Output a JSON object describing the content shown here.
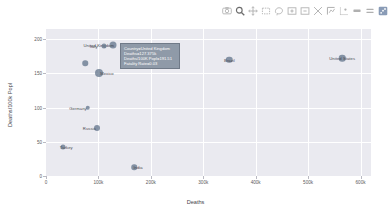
{
  "modebar": {
    "buttons": [
      {
        "name": "download-plot-icon",
        "label": "Download plot as a png"
      },
      {
        "name": "zoom-icon",
        "label": "Zoom"
      },
      {
        "name": "pan-icon",
        "label": "Pan"
      },
      {
        "name": "box-select-icon",
        "label": "Box Select"
      },
      {
        "name": "lasso-select-icon",
        "label": "Lasso Select"
      },
      {
        "name": "zoom-in-icon",
        "label": "Zoom in"
      },
      {
        "name": "zoom-out-icon",
        "label": "Zoom out"
      },
      {
        "name": "autoscale-icon",
        "label": "Autoscale"
      },
      {
        "name": "reset-axes-icon",
        "label": "Reset axes"
      },
      {
        "name": "toggle-spike-lines-icon",
        "label": "Toggle Spike Lines"
      },
      {
        "name": "hover-compare-icon",
        "label": "Show closest data on hover"
      },
      {
        "name": "hover-closest-icon",
        "label": "Compare data on hover"
      },
      {
        "name": "plotly-logo-icon",
        "label": "Produced with Plotly"
      }
    ]
  },
  "tooltip": {
    "lines": [
      "Country=United Kingdom",
      "Deaths=127.375k",
      "Deaths/100K Popl=191.51",
      "Fatality Rate=0.03"
    ]
  },
  "chart_data": {
    "type": "scatter",
    "title": "",
    "xlabel": "Deaths",
    "ylabel": "Deaths/100k Popl",
    "xlim": [
      0,
      620000
    ],
    "ylim": [
      0,
      215
    ],
    "grid": true,
    "legend": "none",
    "xticks": [
      {
        "value": 0,
        "label": "0"
      },
      {
        "value": 100000,
        "label": "100k"
      },
      {
        "value": 200000,
        "label": "200k"
      },
      {
        "value": 300000,
        "label": "300k"
      },
      {
        "value": 400000,
        "label": "400k"
      },
      {
        "value": 500000,
        "label": "500k"
      },
      {
        "value": 600000,
        "label": "600k"
      }
    ],
    "yticks": [
      {
        "value": 0,
        "label": "0"
      },
      {
        "value": 50,
        "label": "50"
      },
      {
        "value": 100,
        "label": "100"
      },
      {
        "value": 150,
        "label": "150"
      },
      {
        "value": 200,
        "label": "200"
      }
    ],
    "points": [
      {
        "label": "United Kingdom",
        "x": 127375,
        "y": 191.51,
        "size": 7.0,
        "label_dx": -14,
        "label_dy": 0
      },
      {
        "label": "Italy",
        "x": 110000,
        "y": 190.0,
        "size": 5.0,
        "label_dx": -10,
        "label_dy": 0
      },
      {
        "label": "",
        "x": 75000,
        "y": 165.0,
        "size": 5.5,
        "label_dx": 0,
        "label_dy": 0
      },
      {
        "label": "Mexico",
        "x": 101000,
        "y": 150.0,
        "size": 8.0,
        "label_dx": 8,
        "label_dy": 0
      },
      {
        "label": "Germany",
        "x": 80000,
        "y": 100.0,
        "size": 4.5,
        "label_dx": -10,
        "label_dy": 0
      },
      {
        "label": "Russia",
        "x": 98000,
        "y": 70.0,
        "size": 6.0,
        "label_dx": -8,
        "label_dy": 0
      },
      {
        "label": "Turkey",
        "x": 33000,
        "y": 42.0,
        "size": 5.0,
        "label_dx": 3,
        "label_dy": 0
      },
      {
        "label": "India",
        "x": 168000,
        "y": 13.0,
        "size": 5.5,
        "label_dx": 4,
        "label_dy": 0
      },
      {
        "label": "Brazil",
        "x": 350000,
        "y": 170.0,
        "size": 6.5,
        "label_dx": 0,
        "label_dy": 0
      },
      {
        "label": "United States",
        "x": 565000,
        "y": 172.0,
        "size": 6.5,
        "label_dx": 0,
        "label_dy": 0
      }
    ]
  }
}
